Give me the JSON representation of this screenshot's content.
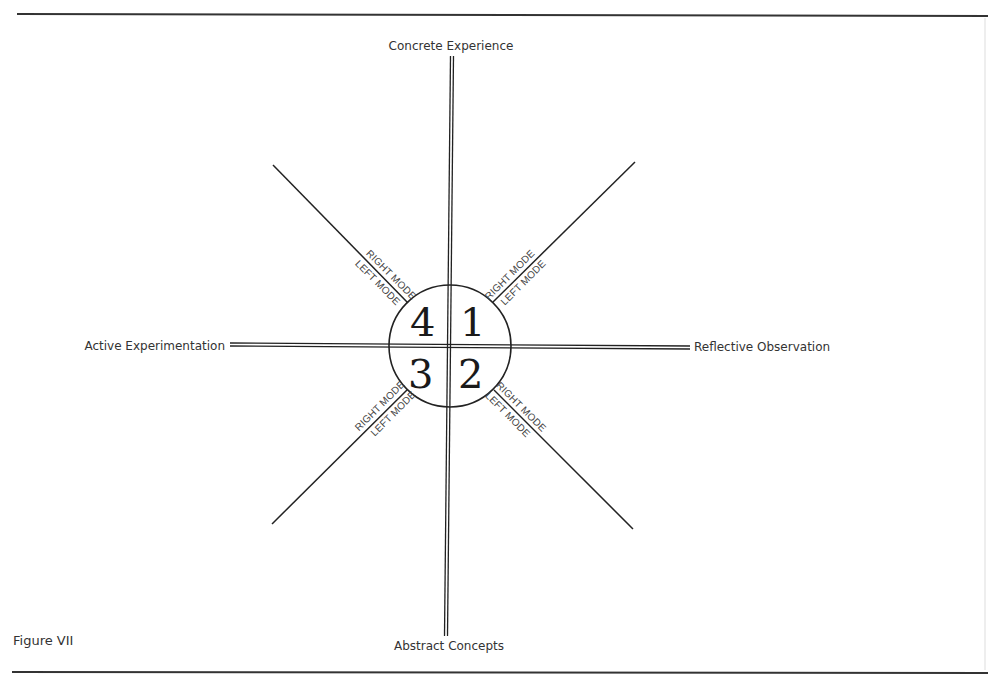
{
  "figure": {
    "caption": "Figure VII",
    "axes": {
      "top": "Concrete Experience",
      "bottom": "Abstract Concepts",
      "left": "Active Experimentation",
      "right": "Reflective Observation"
    },
    "quadrants": {
      "upper_right": "1",
      "lower_right": "2",
      "lower_left": "3",
      "upper_left": "4"
    },
    "diagonal_labels": {
      "upper_left": {
        "outer": "RIGHT MODE",
        "inner": "LEFT MODE"
      },
      "upper_right": {
        "outer": "RIGHT MODE",
        "inner": "LEFT MODE"
      },
      "lower_left": {
        "outer": "RIGHT MODE",
        "inner": "LEFT MODE"
      },
      "lower_right": {
        "outer": "RIGHT MODE",
        "inner": "LEFT MODE"
      }
    },
    "colors": {
      "line": "#222222",
      "text": "#333333",
      "background": "#ffffff"
    }
  }
}
